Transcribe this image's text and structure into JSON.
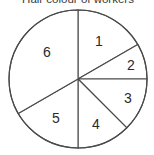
{
  "chart_data": {
    "type": "pie",
    "title": "Hair colour of workers",
    "center": [
      78,
      79
    ],
    "radius": 69,
    "start_angle_deg": 0,
    "direction": "clockwise",
    "slices": [
      {
        "label": "1",
        "angle_deg": 60,
        "fraction": 0.1667,
        "label_pos": [
          99,
          41
        ]
      },
      {
        "label": "2",
        "angle_deg": 30,
        "fraction": 0.0833,
        "label_pos": [
          131,
          65
        ]
      },
      {
        "label": "3",
        "angle_deg": 45,
        "fraction": 0.125,
        "label_pos": [
          128,
          98
        ]
      },
      {
        "label": "4",
        "angle_deg": 45,
        "fraction": 0.125,
        "label_pos": [
          96,
          124
        ]
      },
      {
        "label": "5",
        "angle_deg": 60,
        "fraction": 0.1667,
        "label_pos": [
          56,
          118
        ]
      },
      {
        "label": "6",
        "angle_deg": 120,
        "fraction": 0.3333,
        "label_pos": [
          47,
          52
        ]
      }
    ],
    "categories": [
      "1",
      "2",
      "3",
      "4",
      "5",
      "6"
    ],
    "values": [
      60,
      30,
      45,
      45,
      60,
      120
    ],
    "legend": "none",
    "fill_color": "#ffffff",
    "stroke_color": "#4a4a4a"
  }
}
